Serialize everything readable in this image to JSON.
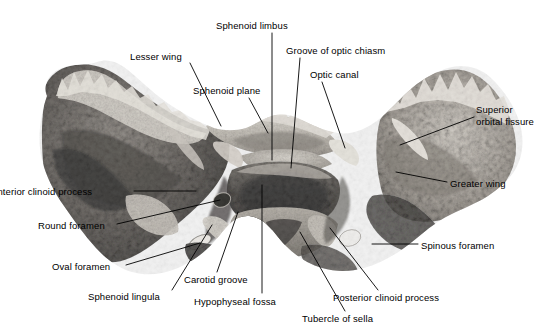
{
  "figure": {
    "background_color": "#ffffff",
    "label_color": "#000000",
    "leader_color": "#000000",
    "width": 560,
    "height": 334
  },
  "specimen": {
    "name": "sphenoid-bone-photograph",
    "description": "Black and white photograph of a dried sphenoid bone viewed from above",
    "tones": {
      "highlight": "#f2efe9",
      "light": "#cfc9c0",
      "mid": "#918b83",
      "dark": "#4e4a45",
      "darkest": "#211f1d",
      "bright_foramen": "#fbfaf7"
    }
  },
  "labels": [
    {
      "id": "lesser-wing",
      "text": "Lesser wing",
      "x": 130,
      "y": 51,
      "lines": 1,
      "leader": [
        [
          190,
          63
        ],
        [
          221,
          126
        ]
      ]
    },
    {
      "id": "sphenoid-limbus",
      "text": "Sphenoid limbus",
      "x": 216,
      "y": 20,
      "lines": 1,
      "leader": [
        [
          272,
          33
        ],
        [
          272,
          160
        ]
      ]
    },
    {
      "id": "groove-of-optic-chiasm",
      "text": "Groove of optic chiasm",
      "x": 286,
      "y": 45,
      "lines": 1,
      "leader": [
        [
          300,
          58
        ],
        [
          291,
          168
        ]
      ]
    },
    {
      "id": "optic-canal",
      "text": "Optic canal",
      "x": 310,
      "y": 69,
      "lines": 1,
      "leader": [
        [
          322,
          82
        ],
        [
          345,
          148
        ]
      ]
    },
    {
      "id": "sphenoid-plane",
      "text": "Sphenoid plane",
      "x": 193,
      "y": 85,
      "lines": 1,
      "leader": [
        [
          249,
          98
        ],
        [
          268,
          133
        ]
      ]
    },
    {
      "id": "superior-orbital-fissure",
      "text": "Superior\norbital fissure",
      "x": 476,
      "y": 104,
      "lines": 2,
      "leader": [
        [
          474,
          117
        ],
        [
          400,
          145
        ]
      ]
    },
    {
      "id": "greater-wing",
      "text": "Greater wing",
      "x": 450,
      "y": 178,
      "lines": 1,
      "leader": [
        [
          447,
          182
        ],
        [
          396,
          172
        ]
      ]
    },
    {
      "id": "anterior-clinoid-process",
      "text": "Anterior clinoid process",
      "x": -9,
      "y": 186,
      "lines": 1,
      "leader": [
        [
          134,
          191
        ],
        [
          196,
          191
        ]
      ]
    },
    {
      "id": "round-foramen",
      "text": "Round foramen",
      "x": 38,
      "y": 220,
      "lines": 1,
      "leader": [
        [
          117,
          224
        ],
        [
          220,
          200
        ]
      ]
    },
    {
      "id": "oval-foramen",
      "text": "Oval foramen",
      "x": 52,
      "y": 261,
      "lines": 1,
      "leader": [
        [
          126,
          265
        ],
        [
          200,
          243
        ]
      ]
    },
    {
      "id": "sphenoid-lingula",
      "text": "Sphenoid lingula",
      "x": 88,
      "y": 291,
      "lines": 1,
      "leader": [
        [
          172,
          290
        ],
        [
          212,
          225
        ]
      ]
    },
    {
      "id": "carotid-groove",
      "text": "Carotid groove",
      "x": 184,
      "y": 274,
      "lines": 1,
      "leader": [
        [
          217,
          272
        ],
        [
          238,
          212
        ]
      ]
    },
    {
      "id": "hypophyseal-fossa",
      "text": "Hypophyseal fossa",
      "x": 194,
      "y": 296,
      "lines": 1,
      "leader": [
        [
          262,
          293
        ],
        [
          262,
          185
        ]
      ]
    },
    {
      "id": "tubercle-of-sella",
      "text": "Tubercle of sella",
      "x": 302,
      "y": 313,
      "lines": 1,
      "leader": [
        [
          345,
          311
        ],
        [
          300,
          232
        ]
      ]
    },
    {
      "id": "posterior-clinoid-process",
      "text": "Posterior clinoid process",
      "x": 333,
      "y": 292,
      "lines": 1,
      "leader": [
        [
          378,
          290
        ],
        [
          330,
          228
        ]
      ]
    },
    {
      "id": "spinous-foramen",
      "text": "Spinous foramen",
      "x": 421,
      "y": 240,
      "lines": 1,
      "leader": [
        [
          418,
          244
        ],
        [
          372,
          244
        ]
      ]
    }
  ]
}
